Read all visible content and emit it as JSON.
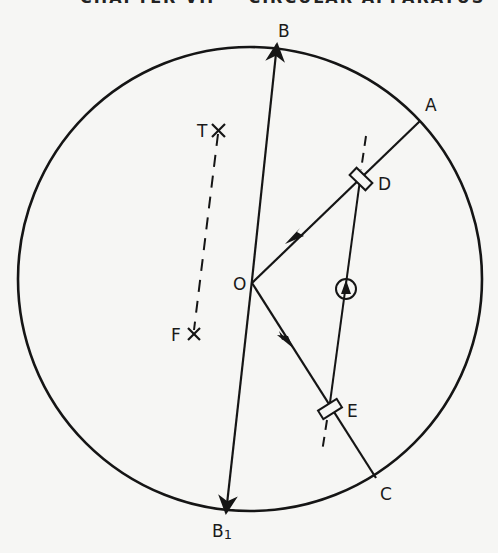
{
  "caption_clipped": "CHAPTER VII — CIRCULAR APPARATUS",
  "diagram": {
    "circle": {
      "cx": 250,
      "cy": 279,
      "r": 232
    },
    "labels": {
      "B": "B",
      "B1_main": "B",
      "B1_sub": "1",
      "A": "A",
      "C": "C",
      "D": "D",
      "E": "E",
      "O": "O",
      "T": "T",
      "F": "F"
    },
    "points": {
      "B": [
        277,
        42
      ],
      "B1": [
        226,
        515
      ],
      "O": [
        252,
        283
      ],
      "A": [
        420,
        121
      ],
      "C": [
        376,
        478
      ],
      "D": [
        360,
        180
      ],
      "E": [
        329,
        410
      ],
      "T": [
        218,
        131
      ],
      "F": [
        193,
        334
      ],
      "circled_arrow": [
        346,
        288
      ]
    },
    "colors": {
      "ink": "#151515",
      "paper": "#f6f6f4"
    }
  }
}
